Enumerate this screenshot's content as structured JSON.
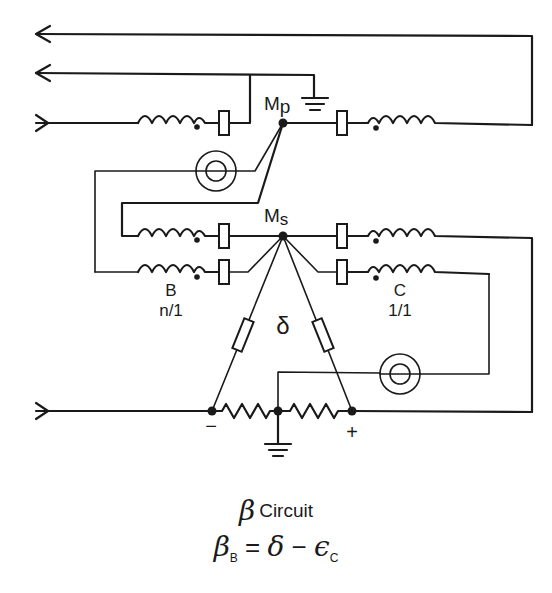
{
  "diagram": {
    "nodes": {
      "primary_mid": {
        "label": "M",
        "subscript": "p"
      },
      "secondary_mid": {
        "label": "M",
        "subscript": "s"
      }
    },
    "transformers": [
      {
        "id": "B",
        "label": "B",
        "ratio": "n/1"
      },
      {
        "id": "C",
        "label": "C",
        "ratio": "1/1"
      }
    ],
    "triangle_label": "δ",
    "polarity": {
      "minus": "−",
      "plus": "+"
    },
    "meters": 2,
    "colors": {
      "ink": "#1a1a1a",
      "background": "#ffffff"
    }
  },
  "caption": {
    "title_symbol": "β",
    "title_text": "Circuit",
    "equation": {
      "lhs_symbol": "β",
      "lhs_subscript": "B",
      "equals": "=",
      "term1": "δ",
      "minus": "−",
      "term2_symbol": "ϵ",
      "term2_subscript": "C"
    }
  }
}
